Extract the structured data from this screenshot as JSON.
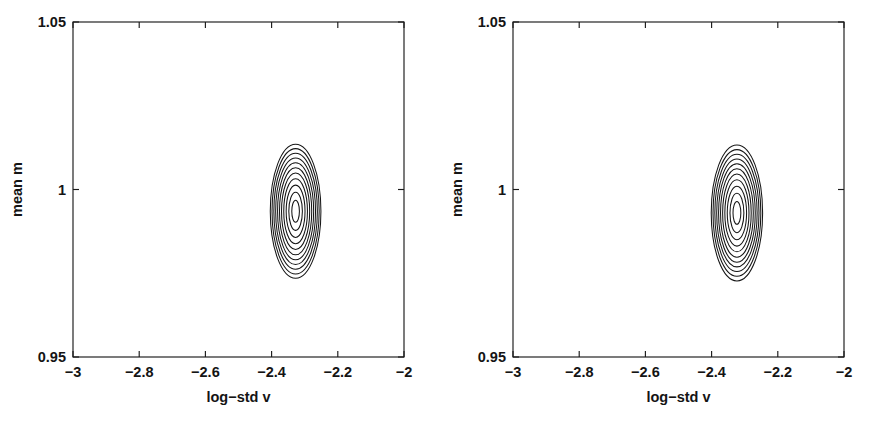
{
  "figure": {
    "background_color": "#ffffff",
    "line_color": "#161616",
    "panel_count": 2
  },
  "chart_data": [
    {
      "type": "contour",
      "panel": "left",
      "title": "",
      "xlabel": "log−std v",
      "ylabel": "mean m",
      "xlim": [
        -3,
        -2
      ],
      "ylim": [
        0.95,
        1.05
      ],
      "xticks": [
        -3,
        -2.8,
        -2.6,
        -2.4,
        -2.2,
        -2
      ],
      "xticklabels": [
        "-3",
        "-2.8",
        "-2.6",
        "-2.4",
        "-2.2",
        "-2"
      ],
      "yticks": [
        0.95,
        1,
        1.05
      ],
      "yticklabels": [
        "0.95",
        "1",
        "1.05"
      ],
      "grid": false,
      "legend": "none",
      "tick_direction": "in",
      "frame": "box",
      "center": {
        "x": -2.3275,
        "y": 0.9935
      },
      "n_levels": 11,
      "levels_note": "11 nested closed elliptical contours around a single peak",
      "contours": [
        {
          "level": 1,
          "rx": 0.0115,
          "ry": 0.0033
        },
        {
          "level": 2,
          "rx": 0.0205,
          "ry": 0.0057
        },
        {
          "level": 3,
          "rx": 0.0285,
          "ry": 0.0078
        },
        {
          "level": 4,
          "rx": 0.0358,
          "ry": 0.0097
        },
        {
          "level": 5,
          "rx": 0.0425,
          "ry": 0.0114
        },
        {
          "level": 6,
          "rx": 0.0487,
          "ry": 0.013
        },
        {
          "level": 7,
          "rx": 0.0545,
          "ry": 0.0145
        },
        {
          "level": 8,
          "rx": 0.0602,
          "ry": 0.0159
        },
        {
          "level": 9,
          "rx": 0.0657,
          "ry": 0.0173
        },
        {
          "level": 10,
          "rx": 0.0712,
          "ry": 0.0187
        },
        {
          "level": 11,
          "rx": 0.0765,
          "ry": 0.02
        }
      ]
    },
    {
      "type": "contour",
      "panel": "right",
      "title": "",
      "xlabel": "log−std v",
      "ylabel": "mean m",
      "xlim": [
        -3,
        -2
      ],
      "ylim": [
        0.95,
        1.05
      ],
      "xticks": [
        -3,
        -2.8,
        -2.6,
        -2.4,
        -2.2,
        -2
      ],
      "xticklabels": [
        "-3",
        "-2.8",
        "-2.6",
        "-2.4",
        "-2.2",
        "-2"
      ],
      "yticks": [
        0.95,
        1,
        1.05
      ],
      "yticklabels": [
        "0.95",
        "1",
        "1.05"
      ],
      "grid": false,
      "legend": "none",
      "tick_direction": "in",
      "frame": "box",
      "center": {
        "x": -2.3235,
        "y": 0.993
      },
      "n_levels": 11,
      "levels_note": "11 nested closed elliptical contours around a single peak",
      "contours": [
        {
          "level": 1,
          "rx": 0.0118,
          "ry": 0.0034
        },
        {
          "level": 2,
          "rx": 0.021,
          "ry": 0.0059
        },
        {
          "level": 3,
          "rx": 0.0292,
          "ry": 0.008
        },
        {
          "level": 4,
          "rx": 0.0365,
          "ry": 0.0099
        },
        {
          "level": 5,
          "rx": 0.0432,
          "ry": 0.0116
        },
        {
          "level": 6,
          "rx": 0.0495,
          "ry": 0.0132
        },
        {
          "level": 7,
          "rx": 0.0554,
          "ry": 0.0147
        },
        {
          "level": 8,
          "rx": 0.0611,
          "ry": 0.0161
        },
        {
          "level": 9,
          "rx": 0.0667,
          "ry": 0.0175
        },
        {
          "level": 10,
          "rx": 0.0722,
          "ry": 0.0189
        },
        {
          "level": 11,
          "rx": 0.0776,
          "ry": 0.0203
        }
      ]
    }
  ]
}
